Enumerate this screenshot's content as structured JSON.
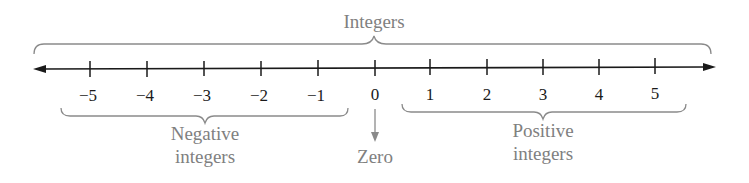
{
  "title": "Integers",
  "number_line": {
    "ticks": [
      {
        "value": -5,
        "label": "−5"
      },
      {
        "value": -4,
        "label": "−4"
      },
      {
        "value": -3,
        "label": "−3"
      },
      {
        "value": -2,
        "label": "−2"
      },
      {
        "value": -1,
        "label": "−1"
      },
      {
        "value": 0,
        "label": "0"
      },
      {
        "value": 1,
        "label": "1"
      },
      {
        "value": 2,
        "label": "2"
      },
      {
        "value": 3,
        "label": "3"
      },
      {
        "value": 4,
        "label": "4"
      },
      {
        "value": 5,
        "label": "5"
      }
    ],
    "arrows": "both ends"
  },
  "groups": {
    "negative": {
      "line1": "Negative",
      "line2": "integers"
    },
    "zero": {
      "label": "Zero"
    },
    "positive": {
      "line1": "Positive",
      "line2": "integers"
    }
  },
  "colors": {
    "line": "#1a1a1a",
    "annotation": "#808080",
    "tick_label": "#1a1a1a"
  }
}
